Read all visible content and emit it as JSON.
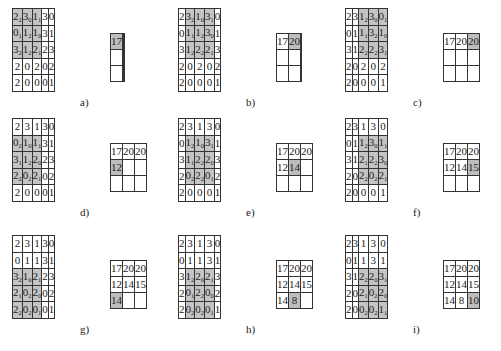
{
  "input": [
    [
      2,
      3,
      1,
      3,
      0
    ],
    [
      0,
      1,
      1,
      3,
      1
    ],
    [
      3,
      1,
      2,
      2,
      3
    ],
    [
      2,
      0,
      2,
      0,
      2
    ],
    [
      2,
      0,
      0,
      0,
      1
    ]
  ],
  "kernel": [
    [
      2,
      0,
      1
    ],
    [
      1,
      2,
      0
    ],
    [
      2,
      2,
      1
    ]
  ],
  "output": [
    [
      17,
      20,
      20
    ],
    [
      12,
      14,
      15
    ],
    [
      14,
      8,
      10
    ]
  ],
  "panels": [
    {
      "label": "a)",
      "row": 0,
      "col": 0
    },
    {
      "label": "b)",
      "row": 0,
      "col": 1
    },
    {
      "label": "c)",
      "row": 0,
      "col": 2
    },
    {
      "label": "d)",
      "row": 1,
      "col": 0
    },
    {
      "label": "e)",
      "row": 1,
      "col": 1
    },
    {
      "label": "f)",
      "row": 1,
      "col": 2
    },
    {
      "label": "g)",
      "row": 2,
      "col": 0
    },
    {
      "label": "h)",
      "row": 2,
      "col": 1
    },
    {
      "label": "i)",
      "row": 2,
      "col": 2
    }
  ]
}
